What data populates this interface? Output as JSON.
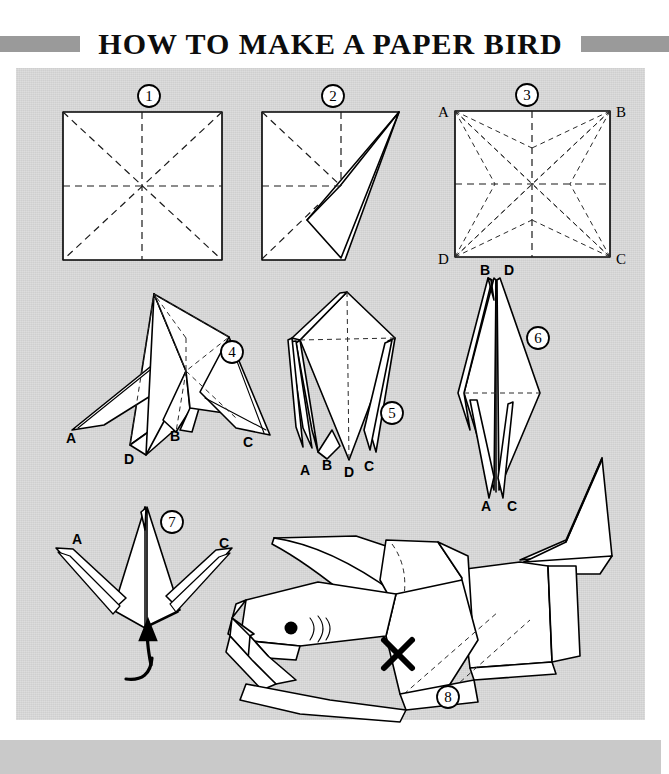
{
  "header": {
    "title": "HOW TO MAKE A PAPER BIRD",
    "left_bar_color": "#9a9a9a",
    "right_bar_color": "#9a9a9a"
  },
  "panel": {
    "background_color": "#d6d6d6",
    "footer_color": "#c9c9c9",
    "footer_text": ""
  },
  "diagram": {
    "type": "origami-instructions",
    "step_count": 8,
    "steps": [
      {
        "number": "1",
        "marker": "①",
        "shape": "square sheet with diagonal and median crease lines",
        "corner_labels": [],
        "creases": [
          "diagonal A-C",
          "diagonal B-D",
          "vertical median",
          "horizontal median"
        ]
      },
      {
        "number": "2",
        "marker": "②",
        "shape": "square with a triangular flap folded out to the right",
        "corner_labels": [],
        "creases": [
          "diagonal",
          "vertical median",
          "horizontal median"
        ]
      },
      {
        "number": "3",
        "marker": "③",
        "shape": "square with full set of crease lines from all four corners",
        "corner_labels": [
          "A",
          "B",
          "C",
          "D"
        ],
        "label_positions": {
          "A": "top-left",
          "B": "top-right",
          "C": "bottom-right",
          "D": "bottom-left"
        },
        "creases": [
          "diagonals",
          "medians",
          "corner fan creases"
        ]
      },
      {
        "number": "4",
        "marker": "④",
        "shape": "opened preliminary base with four spread points",
        "corner_labels": [
          "A",
          "B",
          "C",
          "D"
        ],
        "label_positions": {
          "A": "lower-left",
          "B": "lower-center",
          "C": "lower-right",
          "D": "bottom-center"
        }
      },
      {
        "number": "5",
        "marker": "⑤",
        "shape": "kite-shaped bird base with four points gathered downward",
        "corner_labels": [
          "A",
          "B",
          "D",
          "C"
        ],
        "label_positions": {
          "A": "bottom-left",
          "B": "bottom-left-center",
          "D": "bottom-center",
          "C": "bottom-right"
        }
      },
      {
        "number": "6",
        "marker": "⑥",
        "shape": "narrow diamond with points B and D at top, A and C at bottom",
        "corner_labels": [
          "B",
          "D",
          "A",
          "C"
        ],
        "label_positions": {
          "B": "top-left",
          "D": "top-right",
          "A": "bottom-left",
          "C": "bottom-right"
        }
      },
      {
        "number": "7",
        "marker": "⑦",
        "shape": "crane form with wings A and C spread; arrow indicates pulling up from below",
        "corner_labels": [
          "A",
          "C"
        ],
        "label_positions": {
          "A": "upper-left",
          "C": "upper-right"
        },
        "annotation": "curved arrow pointing upward into the body"
      },
      {
        "number": "8",
        "marker": "⑧",
        "shape": "finished paper bird in flight with eye, beak, wings and tail",
        "corner_labels": [],
        "marks": [
          "eye dot",
          "cheek lines",
          "X mark on body"
        ]
      }
    ]
  }
}
